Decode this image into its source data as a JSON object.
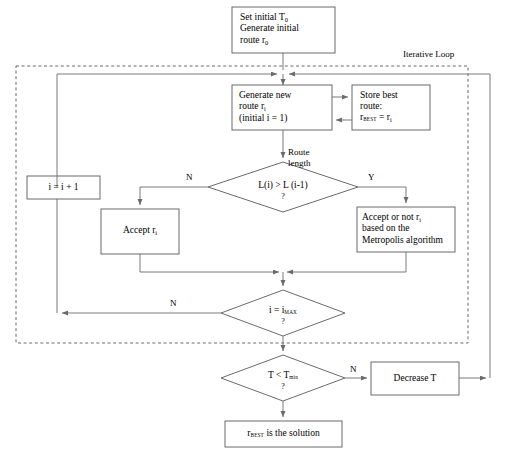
{
  "diagram": {
    "loop_label": "Iterative Loop",
    "colors": {
      "stroke": "#6b6b6b",
      "text": "#000000",
      "background": "#ffffff"
    }
  },
  "nodes": {
    "init": {
      "type": "process",
      "lines": [
        "Set initial T",
        "Generate initial",
        "route r"
      ],
      "line1_main": "Set initial T",
      "line1_sub": "0",
      "line2": "Generate initial",
      "line3_main": "route r",
      "line3_sub": "0"
    },
    "generate_route": {
      "type": "process",
      "line1": "Generate new",
      "line2_main": "route r",
      "line2_sub": "i",
      "line3": "(initial i = 1)"
    },
    "store_best": {
      "type": "process",
      "line1": "Store best",
      "line2": "route:",
      "line3_main": "r",
      "line3_sub": "BEST",
      "line3_tail_main": " = r",
      "line3_tail_sub": "i"
    },
    "route_length_decision": {
      "type": "decision",
      "caption_line1": "Route",
      "caption_line2": "length",
      "text": "L(i) > L (i-1)",
      "question_mark": "?"
    },
    "increment": {
      "type": "process",
      "text": "i = i + 1"
    },
    "accept": {
      "type": "process",
      "text_main": "Accept r",
      "text_sub": "i"
    },
    "metropolis": {
      "type": "process",
      "line1_main": "Accept or not r",
      "line1_sub": "i",
      "line2": "based on the",
      "line3": "Metropolis algorithm"
    },
    "imax_decision": {
      "type": "decision",
      "text_main": "i = i",
      "text_sub": "MAX",
      "question_mark": "?"
    },
    "temp_decision": {
      "type": "decision",
      "text_main": "T < T",
      "text_sub": "min",
      "question_mark": "?"
    },
    "decrease_temp": {
      "type": "process",
      "text": "Decrease T"
    },
    "solution": {
      "type": "terminal",
      "text_main": "r",
      "text_sub": "BEST",
      "text_tail": " is the solution"
    }
  },
  "edge_labels": {
    "route_length_no": "N",
    "route_length_yes": "Y",
    "imax_no": "N",
    "temp_no": "N"
  }
}
